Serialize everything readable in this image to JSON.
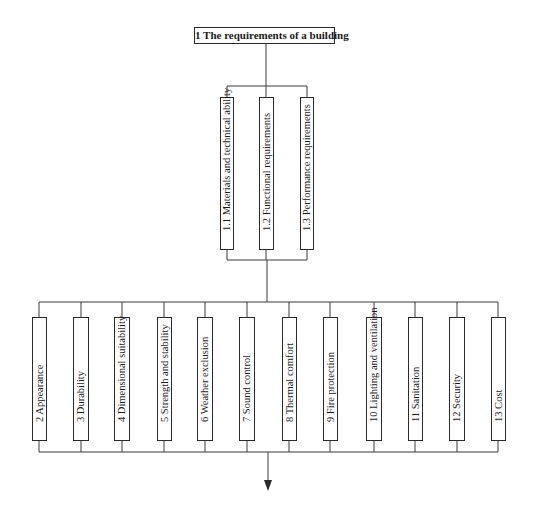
{
  "root": {
    "label": "1  The requirements of a building"
  },
  "sub_requirements": [
    {
      "label": "1.1  Materials and technical ability"
    },
    {
      "label": "1.2  Functional requirements"
    },
    {
      "label": "1.3  Performance requirements"
    }
  ],
  "requirements": [
    {
      "label": "2  Appearance"
    },
    {
      "label": "3  Durability"
    },
    {
      "label": "4  Dimensional suitability"
    },
    {
      "label": "5  Strength and stability"
    },
    {
      "label": "6  Weather exclusion"
    },
    {
      "label": "7  Sound control"
    },
    {
      "label": "8  Thermal comfort"
    },
    {
      "label": "9  Fire protection"
    },
    {
      "label": "10  Lighting and ventilation"
    },
    {
      "label": "11  Sanitation"
    },
    {
      "label": "12  Security"
    },
    {
      "label": "13  Cost"
    }
  ],
  "colors": {
    "line": "#3a3a3a",
    "box_border": "#2a2a2a",
    "background": "#ffffff"
  }
}
